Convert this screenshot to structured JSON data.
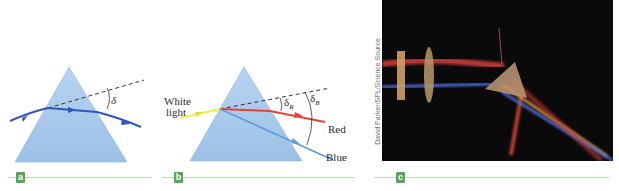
{
  "panels": [
    {
      "id": "a",
      "tag": "a",
      "deviation_symbol": "δ"
    },
    {
      "id": "b",
      "tag": "b",
      "incident_label_line1": "White",
      "incident_label_line2": "light",
      "red_label": "Red",
      "blue_label": "Blue",
      "deviation_red_symbol": "δ",
      "deviation_red_sub": "R",
      "deviation_blue_symbol": "δ",
      "deviation_blue_sub": "B"
    },
    {
      "id": "c",
      "tag": "c",
      "photo_credit": "David Parker/SPL/Science Source"
    }
  ],
  "colors": {
    "prism_fill": "#a9c9ea",
    "ray_a": "#2f56b8",
    "white_light": "#f1ee4c",
    "red_ray": "#e2443a",
    "blue_ray": "#5f9ad9",
    "tag_green": "#5aa35a",
    "rule_green": "#b9dcae",
    "photo_bg": "#0b0a0b"
  }
}
